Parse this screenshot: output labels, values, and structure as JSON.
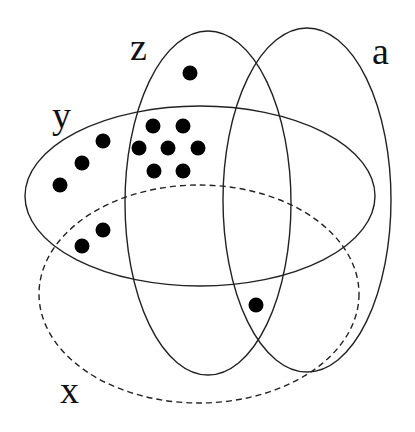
{
  "diagram": {
    "type": "venn",
    "width": 415,
    "height": 432,
    "stroke_color": "#222222",
    "dot_color": "#000000",
    "sets": [
      {
        "name": "z",
        "label": "z",
        "style": "solid",
        "cx": 208,
        "cy": 203,
        "rx": 83,
        "ry": 172,
        "label_x": 130,
        "label_y": 60
      },
      {
        "name": "a",
        "label": "a",
        "style": "solid",
        "cx": 307,
        "cy": 200,
        "rx": 84,
        "ry": 172,
        "label_x": 372,
        "label_y": 64
      },
      {
        "name": "y",
        "label": "y",
        "style": "solid",
        "cx": 200,
        "cy": 196,
        "rx": 175,
        "ry": 90,
        "label_x": 52,
        "label_y": 128
      },
      {
        "name": "x",
        "label": "x",
        "style": "dashed",
        "cx": 199,
        "cy": 294,
        "rx": 160,
        "ry": 109,
        "label_x": 60,
        "label_y": 403
      }
    ],
    "points": [
      {
        "x": 190,
        "y": 73,
        "region": "z only"
      },
      {
        "x": 153,
        "y": 126,
        "region": "y∩z"
      },
      {
        "x": 183,
        "y": 126,
        "region": "y∩z"
      },
      {
        "x": 139,
        "y": 148,
        "region": "y∩z"
      },
      {
        "x": 168,
        "y": 148,
        "region": "y∩z"
      },
      {
        "x": 198,
        "y": 148,
        "region": "y∩z"
      },
      {
        "x": 154,
        "y": 171,
        "region": "y∩z"
      },
      {
        "x": 183,
        "y": 171,
        "region": "y∩z"
      },
      {
        "x": 103,
        "y": 141,
        "region": "y only"
      },
      {
        "x": 82,
        "y": 163,
        "region": "y only"
      },
      {
        "x": 60,
        "y": 185,
        "region": "y only"
      },
      {
        "x": 103,
        "y": 230,
        "region": "x∩y"
      },
      {
        "x": 82,
        "y": 246,
        "region": "x∩y"
      },
      {
        "x": 256,
        "y": 305,
        "region": "x∩z∩a"
      }
    ],
    "dot_radius": 7.5
  }
}
